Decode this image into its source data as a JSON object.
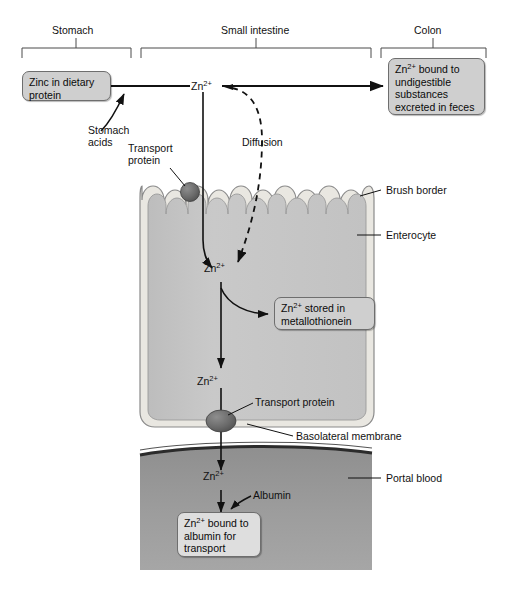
{
  "figure": {
    "regions": [
      {
        "id": "stomach",
        "label": "Stomach"
      },
      {
        "id": "small-intestine",
        "label": "Small intestine"
      },
      {
        "id": "colon",
        "label": "Colon"
      }
    ],
    "boxes": [
      {
        "id": "zinc-dietary-protein",
        "lines": [
          "Zinc in dietary",
          "protein"
        ]
      },
      {
        "id": "zn-bound-undigestible",
        "lines": [
          "Zn2+ bound to",
          "undigestible",
          "substances",
          "excreted in feces"
        ]
      },
      {
        "id": "zn-stored-metallothionein",
        "lines": [
          "Zn2+ stored in",
          "metallothionein"
        ]
      },
      {
        "id": "zn-bound-albumin",
        "lines": [
          "Zn2+ bound to",
          "albumin for",
          "transport"
        ]
      }
    ],
    "labels": {
      "stomach_acids": "Stomach\nacids",
      "stomach_acids_line1": "Stomach",
      "stomach_acids_line2": "acids",
      "transport_protein_apical_line1": "Transport",
      "transport_protein_apical_line2": "protein",
      "diffusion": "Diffusion",
      "brush_border": "Brush border",
      "enterocyte": "Enterocyte",
      "transport_protein_basal": "Transport protein",
      "basolateral_membrane": "Basolateral membrane",
      "portal_blood": "Portal blood",
      "albumin": "Albumin"
    },
    "ion_labels": [
      {
        "id": "zn-lumen",
        "base": "Zn",
        "charge": "2+"
      },
      {
        "id": "zn-cytoplasm-top",
        "base": "Zn",
        "charge": "2+"
      },
      {
        "id": "zn-cytoplasm-bottom",
        "base": "Zn",
        "charge": "2+"
      },
      {
        "id": "zn-portal-blood",
        "base": "Zn",
        "charge": "2+"
      }
    ],
    "box_text": {
      "zinc_dietary_protein_l1": "Zinc in dietary",
      "zinc_dietary_protein_l2": "protein",
      "undigestible_l1_base": "Zn",
      "undigestible_l1_charge": "2+",
      "undigestible_l1_rest": " bound to",
      "undigestible_l2": "undigestible",
      "undigestible_l3": "substances",
      "undigestible_l4": "excreted in feces",
      "metallothionein_l1_base": "Zn",
      "metallothionein_l1_charge": "2+",
      "metallothionein_l1_rest": " stored in",
      "metallothionein_l2": "metallothionein",
      "albumin_box_l1_base": "Zn",
      "albumin_box_l1_charge": "2+",
      "albumin_box_l1_rest": " bound to",
      "albumin_box_l2": "albumin for",
      "albumin_box_l3": "transport"
    },
    "colors": {
      "cytoplasm": "#c6c6c6",
      "brush_border_fill": "#e8e6e0",
      "membrane_outline": "#707070",
      "portal_blood": "#9a9a9a",
      "portal_blood_edge": "#2b2b2b",
      "protein_sphere": "#6a6a6a",
      "box_fill": "#cfcfcf",
      "box_border": "#6e6e6e",
      "stroke": "#111111",
      "background": "#ffffff"
    }
  }
}
